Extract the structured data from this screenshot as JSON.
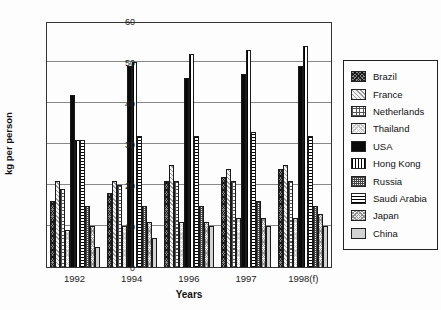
{
  "chart_data": {
    "type": "bar",
    "title": "",
    "xlabel": "Years",
    "ylabel": "kg per person",
    "ylim": [
      0,
      60
    ],
    "yticks": [
      0,
      10,
      20,
      30,
      40,
      50,
      60
    ],
    "grid": true,
    "legend_position": "right",
    "categories": [
      "1992",
      "1994",
      "1996",
      "1997",
      "1998(f)"
    ],
    "series": [
      {
        "name": "Brazil",
        "pattern": "p-brazil",
        "values": [
          16,
          18,
          21,
          22,
          24
        ]
      },
      {
        "name": "France",
        "pattern": "p-france",
        "values": [
          21,
          21,
          25,
          24,
          25
        ]
      },
      {
        "name": "Netherlands",
        "pattern": "p-netherlands",
        "values": [
          19,
          20,
          21,
          21,
          21
        ]
      },
      {
        "name": "Thailand",
        "pattern": "p-thailand",
        "values": [
          9,
          10,
          11,
          12,
          12
        ]
      },
      {
        "name": "USA",
        "pattern": "p-usa",
        "values": [
          42,
          49,
          46,
          47,
          49
        ]
      },
      {
        "name": "Hong Kong",
        "pattern": "p-hongkong",
        "values": [
          31,
          50,
          52,
          53,
          54
        ]
      },
      {
        "name": "Russia",
        "pattern": "p-russia",
        "values": [
          15,
          15,
          15,
          16,
          15
        ]
      },
      {
        "name": "Saudi Arabia",
        "pattern": "p-saudiarabia",
        "values": [
          31,
          32,
          32,
          33,
          32
        ]
      },
      {
        "name": "Japan",
        "pattern": "p-japan",
        "values": [
          10,
          11,
          11,
          12,
          13
        ]
      },
      {
        "name": "China",
        "pattern": "p-china",
        "values": [
          5,
          7,
          10,
          10,
          10
        ]
      }
    ],
    "bar_draw_order": [
      "Brazil",
      "France",
      "Netherlands",
      "Thailand",
      "USA",
      "Hong Kong",
      "Saudi Arabia",
      "Russia",
      "Japan",
      "China"
    ]
  },
  "legend": {
    "items": [
      "Brazil",
      "France",
      "Netherlands",
      "Thailand",
      "USA",
      "Hong Kong",
      "Russia",
      "Saudi Arabia",
      "Japan",
      "China"
    ]
  }
}
